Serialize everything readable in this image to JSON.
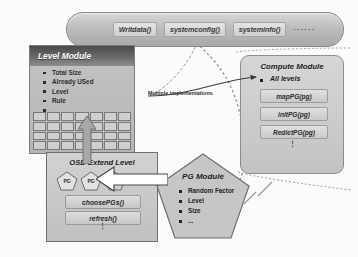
{
  "diagram": {
    "colors": {
      "module_fill": "#c4c4c4",
      "header_dark": "#4a4a4a",
      "chip_fill": "#dddddd",
      "border": "#7d7d7d",
      "background": "#fbfbfb"
    }
  },
  "interface_capsule": {
    "name": "api-capsule",
    "apis": [
      "Writdata()",
      "systemconfig()",
      "systeminfo()"
    ],
    "ellipsis": "······"
  },
  "level_module": {
    "title": "Level Module",
    "attributes": [
      "Total Size",
      "Already USed",
      "Level",
      "Rule",
      "..."
    ],
    "grid": {
      "columns": 7,
      "rows": 4
    }
  },
  "osd_module": {
    "title": "OSD Extend Level",
    "pg_nodes": [
      "PG",
      "PG",
      "PG"
    ],
    "methods": [
      "choosePGs()",
      "refresh()"
    ],
    "ellipsis": "⋮"
  },
  "pg_module": {
    "title": "PG Module",
    "attributes": [
      "Random Factor",
      "Level",
      "Size",
      "..."
    ]
  },
  "compute_module": {
    "title": "Compute Module",
    "attribute": "All levels",
    "methods": [
      "mapPG(pg)",
      "initPG(pg)",
      "RedictPG(pg)"
    ],
    "ellipsis": "⋮"
  },
  "connectors": {
    "multiple_implementations": "Multiple implementations"
  }
}
